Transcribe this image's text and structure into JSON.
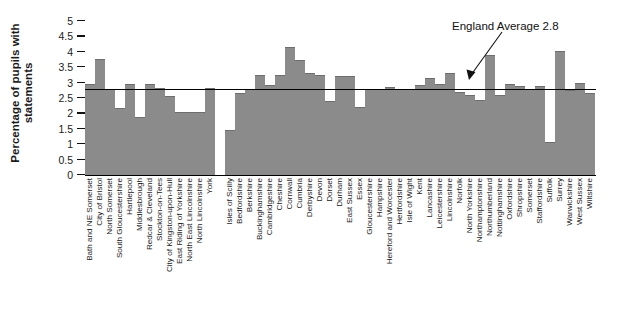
{
  "chart_data": {
    "type": "bar",
    "title": "",
    "subtitle": "",
    "xlabel": "",
    "ylabel": "Percentage of pupils with statements",
    "ylabel_lines": [
      "Percentage of pupils with",
      "statements"
    ],
    "ylim": [
      0,
      5
    ],
    "ytick_values": [
      5,
      4.5,
      4,
      3.5,
      3,
      2.5,
      2,
      1.5,
      1,
      0.5,
      0
    ],
    "ytick_labels": [
      "5",
      "4.5",
      "4",
      "3.5",
      "3",
      "2.5",
      "2",
      "1.5",
      "1",
      "0.5",
      "0"
    ],
    "grid": false,
    "legend": null,
    "bar_color": "#8b8b8b",
    "reference_line": {
      "label": "England Average 2.8",
      "value": 2.8,
      "color": "#000000"
    },
    "annotations": [
      {
        "text": "England Average 2.8",
        "points_to": "reference-line"
      }
    ],
    "categories": [
      "Bath and NE Somerset",
      "City of Bristol",
      "North Somerset",
      "South Gloucestershire",
      "Hartlepool",
      "Middlesbrough",
      "Redcar & Cleveland",
      "Stockton-on-Tees",
      "City of Kingston-upon-Hull",
      "East Riding of Yorkshire",
      "North East Lincolnshire",
      "North Lincolnshire",
      "York",
      "",
      "Isles of Scilly",
      "Bedfordshire",
      "Berkshire",
      "Buckinghamshire",
      "Cambridgeshire",
      "Cheshire",
      "Cornwall",
      "Cumbria",
      "Derbyshire",
      "Devon",
      "Dorset",
      "Durham",
      "East Sussex",
      "Essex",
      "Gloucestershire",
      "Hampshire",
      "Hereford and Worcester",
      "Hertfordshire",
      "Isle of Wight",
      "Kent",
      "Lancashire",
      "Leicestershire",
      "Lincolnshire",
      "Norfolk",
      "North Yorkshire",
      "Northamptonshire",
      "Northumberland",
      "Nottinghamshire",
      "Oxfordshire",
      "Shropshire",
      "Somerset",
      "Staffordshire",
      "Suffolk",
      "Surrey",
      "Warwickshire",
      "West Sussex",
      "Wiltshire"
    ],
    "values": [
      2.97,
      3.77,
      2.8,
      2.17,
      2.95,
      1.87,
      2.95,
      2.83,
      2.57,
      2.05,
      2.05,
      2.05,
      2.83,
      null,
      1.45,
      2.65,
      2.8,
      3.25,
      2.92,
      3.25,
      4.15,
      3.73,
      3.32,
      3.25,
      2.4,
      3.22,
      3.22,
      2.2,
      2.78,
      2.78,
      2.85,
      2.78,
      2.78,
      2.92,
      3.15,
      2.95,
      3.32,
      2.7,
      2.6,
      2.45,
      3.9,
      2.6,
      2.95,
      2.88,
      2.78,
      2.9,
      1.08,
      4.02,
      2.75,
      2.98,
      2.65
    ]
  }
}
